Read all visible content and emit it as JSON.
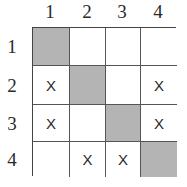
{
  "matrix": {
    "column_labels": [
      "1",
      "2",
      "3",
      "4"
    ],
    "row_labels": [
      "1",
      "2",
      "3",
      "4"
    ],
    "shaded_color": "#b4b4b4",
    "cells": [
      [
        "",
        "",
        "",
        ""
      ],
      [
        "X",
        "",
        "",
        "X"
      ],
      [
        "X",
        "",
        "",
        "X"
      ],
      [
        "",
        "X",
        "X",
        ""
      ]
    ],
    "shaded": [
      [
        true,
        false,
        false,
        false
      ],
      [
        false,
        true,
        false,
        false
      ],
      [
        false,
        false,
        true,
        false
      ],
      [
        false,
        false,
        false,
        true
      ]
    ]
  }
}
